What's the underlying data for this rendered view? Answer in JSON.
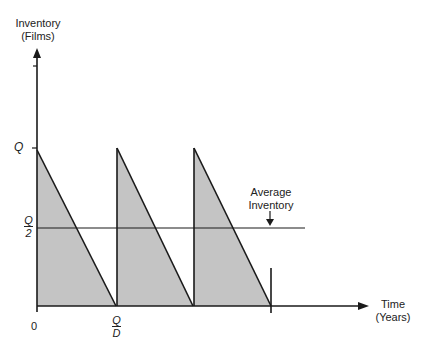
{
  "diagram": {
    "type": "inventory-sawtooth",
    "y_axis": {
      "label_line1": "Inventory",
      "label_line2": "(Films)"
    },
    "x_axis": {
      "label_line1": "Time",
      "label_line2": "(Years)"
    },
    "y_ticks": {
      "q": "Q",
      "q_half_num": "Q",
      "q_half_den": "2"
    },
    "x_ticks": {
      "zero": "0",
      "qd_num": "Q",
      "qd_den": "D"
    },
    "annotation": {
      "line1": "Average",
      "line2": "Inventory"
    },
    "colors": {
      "fill": "#c4c4c4",
      "stroke": "#1a1a1a"
    },
    "cycles": 3
  }
}
